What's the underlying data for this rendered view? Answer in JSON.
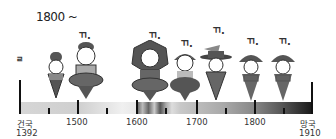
{
  "title": "1800 ~",
  "marker_label": "ㄲ.",
  "timeline": {
    "start": {
      "label": "건국",
      "year": "1392"
    },
    "end": {
      "label": "망국",
      "year": "1910"
    },
    "ticks": [
      {
        "label": "1500",
        "x": 76
      },
      {
        "label": "1600",
        "x": 136
      },
      {
        "label": "1700",
        "x": 196
      },
      {
        "label": "1800",
        "x": 254
      }
    ]
  },
  "figures": [
    {
      "id": "fig1",
      "marker": "ㄹ",
      "has_marker": true
    },
    {
      "id": "fig2",
      "marker": "ㄲ.",
      "has_marker": true
    },
    {
      "id": "fig3",
      "marker": "ㄲ.",
      "has_marker": true
    },
    {
      "id": "fig4",
      "marker": "ㄲ.",
      "has_marker": true
    },
    {
      "id": "fig5",
      "marker": "ㄲ.",
      "has_marker": true
    },
    {
      "id": "fig6",
      "marker": "ㄲ.",
      "has_marker": true
    },
    {
      "id": "fig7",
      "marker": "ㄲ.",
      "has_marker": true
    }
  ]
}
